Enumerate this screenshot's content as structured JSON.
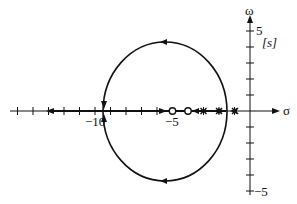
{
  "diagram": {
    "type": "root-locus",
    "plane_label": "[s]",
    "axes": {
      "real_label": "σ",
      "imag_label": "ω",
      "real_tick_labels": [
        "−10",
        "−5"
      ],
      "imag_tick_labels": [
        "5",
        "−5"
      ],
      "real_range": [
        -15,
        5
      ],
      "imag_range": [
        -5,
        5
      ]
    },
    "zeros": [
      -5,
      -4
    ],
    "poles": [
      -3,
      -2,
      -1.5,
      -1.2
    ],
    "locus": {
      "circle_center": -5.5,
      "breakaway_point": -1.4,
      "break_in_point": -9.5,
      "description": "Closed loop around zeros with branches leaving real axis near σ≈-1.4 and re-entering at σ≈-9.5, then continuing to -∞"
    },
    "colors": {
      "stroke": "#111111",
      "background": "#ffffff"
    }
  }
}
